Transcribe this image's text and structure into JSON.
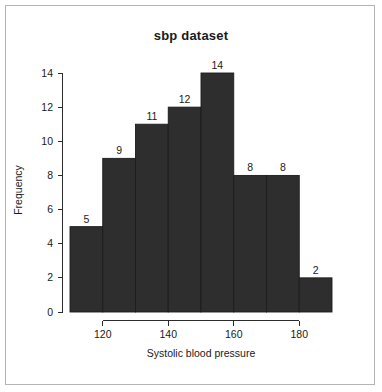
{
  "chart_data": {
    "type": "bar",
    "title": "sbp dataset",
    "xlabel": "Systolic blood pressure",
    "ylabel": "Frequency",
    "categories": [
      "110-120",
      "120-130",
      "130-140",
      "140-150",
      "150-160",
      "160-170",
      "170-180",
      "180-190"
    ],
    "bin_edges": [
      110,
      120,
      130,
      140,
      150,
      160,
      170,
      180,
      190
    ],
    "values": [
      5,
      9,
      11,
      12,
      14,
      8,
      8,
      2
    ],
    "bar_labels": [
      "5",
      "9",
      "11",
      "12",
      "14",
      "8",
      "8",
      "2"
    ],
    "xlim": [
      110,
      190
    ],
    "ylim": [
      0,
      14
    ],
    "x_ticks": [
      120,
      140,
      160,
      180
    ],
    "x_tick_labels": [
      "120",
      "140",
      "160",
      "180"
    ],
    "y_ticks": [
      0,
      2,
      4,
      6,
      8,
      10,
      12,
      14
    ],
    "y_tick_labels": [
      "0",
      "2",
      "4",
      "6",
      "8",
      "10",
      "12",
      "14"
    ],
    "grid": false,
    "legend": false,
    "bar_color": "#2e2e2e",
    "bar_border_color": "#1c1c1c",
    "axis_color": "#2b2b2b",
    "background_color": "#ffffff",
    "frame_color": "#b4b4b4"
  }
}
